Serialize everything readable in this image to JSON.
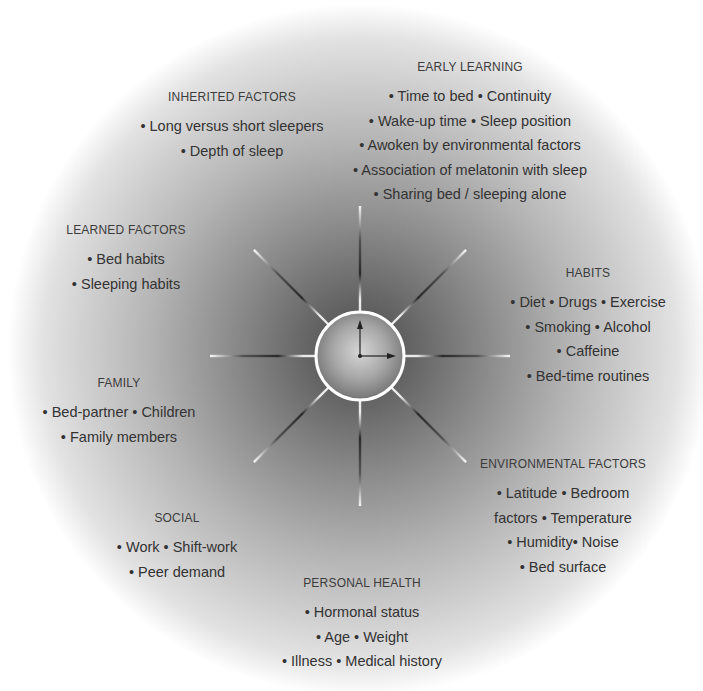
{
  "diagram": {
    "center": {
      "label": "clock",
      "description": "central clock hub with hour and minute hands"
    },
    "factors": [
      {
        "id": "early-learning",
        "title": "EARLY LEARNING",
        "x": 470,
        "y": 60,
        "lines": [
          "• Time to bed • Continuity",
          "• Wake-up time • Sleep position",
          "• Awoken by environmental factors",
          "• Association of melatonin with sleep",
          "• Sharing bed / sleeping alone"
        ]
      },
      {
        "id": "inherited-factors",
        "title": "INHERITED FACTORS",
        "x": 232,
        "y": 90,
        "lines": [
          "• Long versus short sleepers",
          "• Depth of sleep"
        ]
      },
      {
        "id": "learned-factors",
        "title": "LEARNED FACTORS",
        "x": 126,
        "y": 223,
        "lines": [
          "• Bed habits",
          "• Sleeping habits"
        ]
      },
      {
        "id": "habits",
        "title": "HABITS",
        "x": 588,
        "y": 266,
        "lines": [
          "• Diet • Drugs • Exercise",
          "• Smoking • Alcohol",
          "• Caffeine",
          "• Bed-time routines"
        ]
      },
      {
        "id": "family",
        "title": "FAMILY",
        "x": 119,
        "y": 376,
        "lines": [
          "• Bed-partner • Children",
          "• Family members"
        ]
      },
      {
        "id": "environmental-factors",
        "title": "ENVIRONMENTAL FACTORS",
        "x": 563,
        "y": 457,
        "lines": [
          "• Latitude • Bedroom",
          "factors • Temperature",
          "• Humidity• Noise",
          "• Bed surface"
        ]
      },
      {
        "id": "social",
        "title": "SOCIAL",
        "x": 177,
        "y": 511,
        "lines": [
          "• Work • Shift-work",
          "• Peer demand"
        ]
      },
      {
        "id": "personal-health",
        "title": "PERSONAL HEALTH",
        "x": 362,
        "y": 576,
        "lines": [
          "• Hormonal status",
          "• Age • Weight",
          "• Illness • Medical history"
        ]
      }
    ],
    "colors": {
      "text": "#333333",
      "ray_light": "#f2f2f2",
      "ray_dark": "#2a2a2a",
      "hub_ring": "#ffffff"
    }
  }
}
